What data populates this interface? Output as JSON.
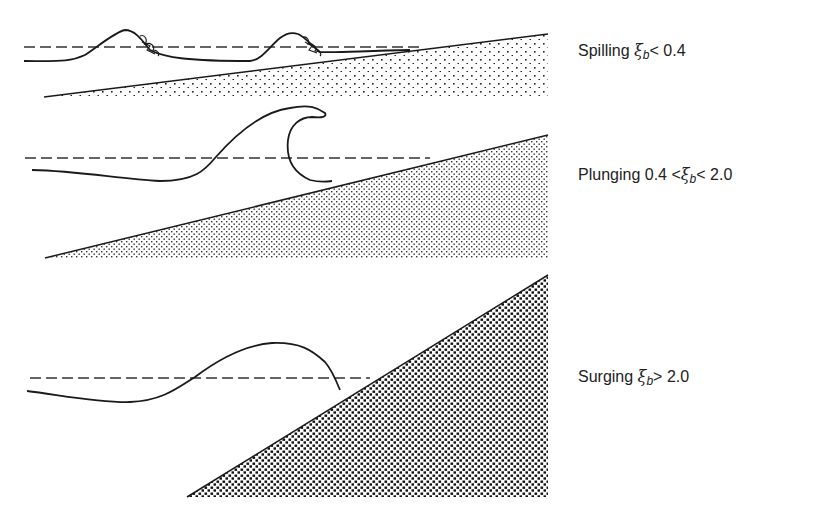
{
  "figure": {
    "colors": {
      "ink": "#1a1a1a",
      "background": "#ffffff"
    },
    "panels": [
      {
        "id": "spilling",
        "label": {
          "name": "Spilling",
          "symbol": "ξ",
          "subscript": "b",
          "condition": "< 0.4",
          "prefix": ""
        },
        "label_pos": {
          "x": 578,
          "y": 51
        },
        "slope": {
          "x1": 44,
          "y1": 97,
          "x2": 548,
          "y2": 34,
          "bottom": 97
        },
        "swl": {
          "y": 47,
          "x1": 24,
          "x2": 420
        },
        "fill": "sparse-dots",
        "wave_path": "M24,61 C60,61 70,62 85,55 C100,45 115,32 125,30 C135,30 142,40 150,50 C165,58 190,61 250,61 C262,60 270,46 280,38 C285,34 292,32 298,34 C305,37 312,46 320,52 C335,53 360,51 410,50"
      },
      {
        "id": "plunging",
        "label": {
          "name": "Plunging",
          "prefix": "0.4 <",
          "symbol": "ξ",
          "subscript": "b",
          "condition": "< 2.0"
        },
        "label_pos": {
          "x": 578,
          "y": 175
        },
        "slope": {
          "x1": 45,
          "y1": 258,
          "x2": 548,
          "y2": 135,
          "bottom": 258
        },
        "swl": {
          "y": 158,
          "x1": 25,
          "x2": 430
        },
        "fill": "dense-dots",
        "wave_path": "M32,170 C80,171 120,179 160,181 C195,181 205,170 215,158 C235,135 260,112 290,108 C310,104 318,108 325,113 C327,117 322,118 312,117 C300,117 290,125 288,140 C286,158 292,172 310,180 C318,182 325,182 332,181"
      },
      {
        "id": "surging",
        "label": {
          "name": "Surging",
          "symbol": "ξ",
          "subscript": "b",
          "condition": "> 2.0",
          "prefix": ""
        },
        "label_pos": {
          "x": 578,
          "y": 377
        },
        "slope": {
          "x1": 187,
          "y1": 497,
          "x2": 548,
          "y2": 275,
          "bottom": 497
        },
        "swl": {
          "y": 378,
          "x1": 30,
          "x2": 370
        },
        "fill": "coarse-checker",
        "wave_path": "M27,391 C60,395 100,403 130,402 C160,401 175,390 195,377 C220,358 245,345 272,343 C300,342 312,350 325,362 C332,370 336,380 340,390"
      }
    ]
  }
}
